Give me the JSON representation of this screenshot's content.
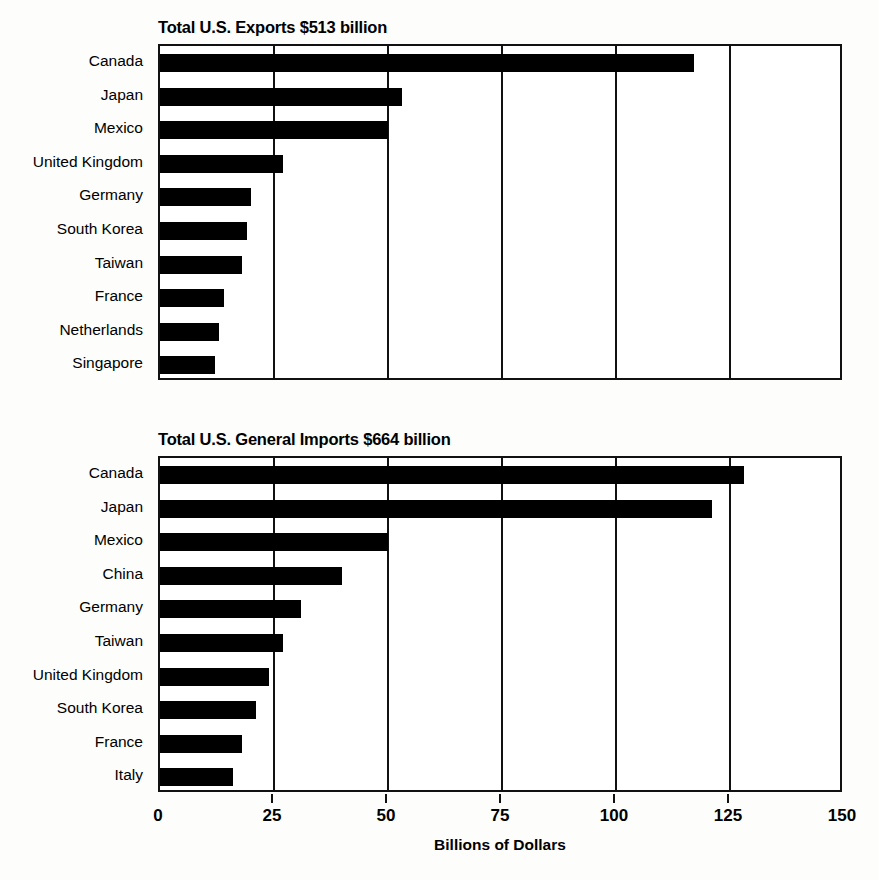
{
  "figure": {
    "axis_label": "Billions of Dollars",
    "bar_color": "#000000",
    "axis_color": "#111111"
  },
  "chart_data": [
    {
      "type": "bar",
      "orientation": "horizontal",
      "title": "Total U.S. Exports $513 billion",
      "xlabel": "Billions of Dollars",
      "ylabel": "",
      "xlim": [
        0,
        150
      ],
      "ticks": [
        0,
        25,
        50,
        75,
        100,
        125,
        150
      ],
      "tick_labels": [
        "0",
        "25",
        "50",
        "75",
        "100",
        "125",
        "150"
      ],
      "grid": true,
      "legend": "none",
      "total_label": "$513 billion",
      "categories": [
        "Canada",
        "Japan",
        "Mexico",
        "United Kingdom",
        "Germany",
        "South Korea",
        "Taiwan",
        "France",
        "Netherlands",
        "Singapore"
      ],
      "values": [
        117,
        53,
        50,
        27,
        20,
        19,
        18,
        14,
        13,
        12
      ]
    },
    {
      "type": "bar",
      "orientation": "horizontal",
      "title": "Total U.S. General Imports $664 billion",
      "xlabel": "Billions of Dollars",
      "ylabel": "",
      "xlim": [
        0,
        150
      ],
      "ticks": [
        0,
        25,
        50,
        75,
        100,
        125,
        150
      ],
      "tick_labels": [
        "0",
        "25",
        "50",
        "75",
        "100",
        "125",
        "150"
      ],
      "grid": true,
      "legend": "none",
      "total_label": "$664 billion",
      "categories": [
        "Canada",
        "Japan",
        "Mexico",
        "China",
        "Germany",
        "Taiwan",
        "United Kingdom",
        "South Korea",
        "France",
        "Italy"
      ],
      "values": [
        128,
        121,
        50,
        40,
        31,
        27,
        24,
        21,
        18,
        16
      ]
    }
  ]
}
